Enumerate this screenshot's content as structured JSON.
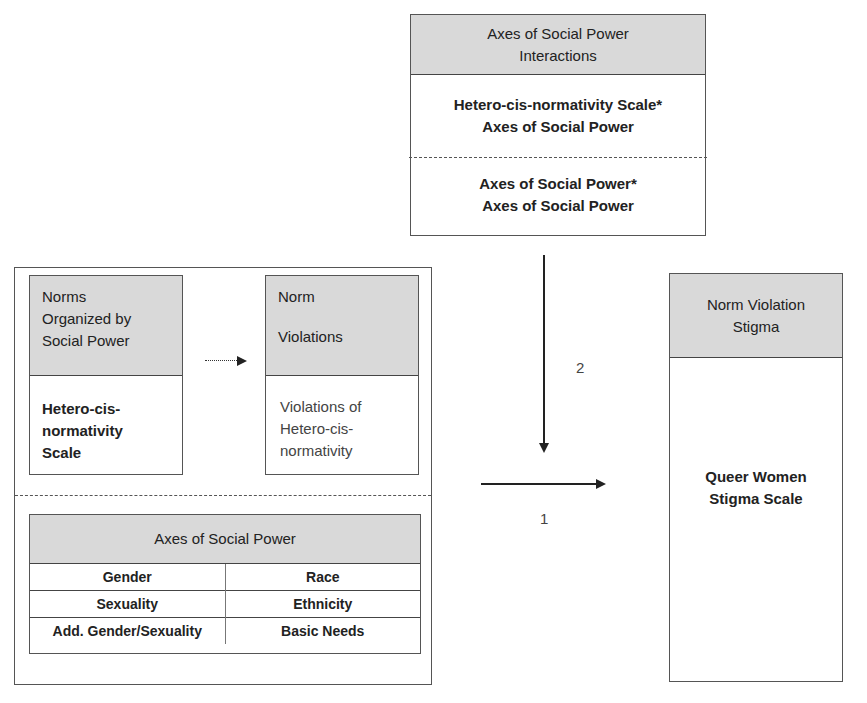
{
  "interactions_box": {
    "header": "Axes of Social Power Interactions",
    "header_line1": "Axes of Social Power",
    "header_line2": "Interactions",
    "item1_line1": "Hetero-cis-normativity Scale*",
    "item1_line2": "Axes of Social Power",
    "item2_line1": "Axes of Social Power*",
    "item2_line2": "Axes of Social Power"
  },
  "norms_box": {
    "header_line1": "Norms",
    "header_line2": "Organized by",
    "header_line3": "Social Power",
    "body_line1": "Hetero-cis-",
    "body_line2": "normativity",
    "body_line3": "Scale"
  },
  "violations_box": {
    "header_line1": "Norm",
    "header_line2": "Violations",
    "body_line1": "Violations of",
    "body_line2": "Hetero-cis-",
    "body_line3": "normativity"
  },
  "axes_box": {
    "header": "Axes of Social Power",
    "rows": [
      {
        "left": "Gender",
        "right": "Race"
      },
      {
        "left": "Sexuality",
        "right": "Ethnicity"
      },
      {
        "left": "Add. Gender/Sexuality",
        "right": "Basic Needs"
      }
    ]
  },
  "stigma_box": {
    "header_line1": "Norm Violation",
    "header_line2": "Stigma",
    "body_line1": "Queer Women",
    "body_line2": "Stigma Scale"
  },
  "arrows": {
    "path1_label": "1",
    "path2_label": "2"
  }
}
